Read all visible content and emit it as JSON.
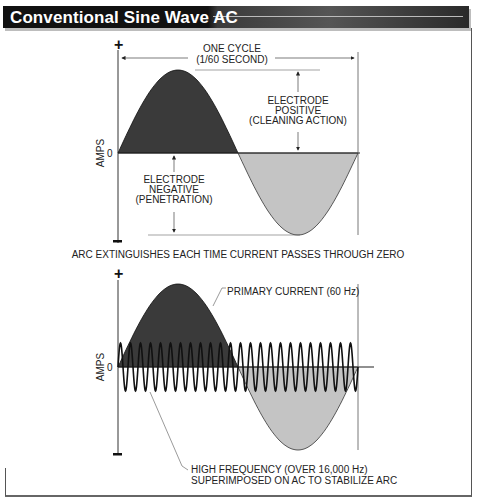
{
  "title": "Conventional Sine Wave AC",
  "colors": {
    "positive_fill": "#3a3a3a",
    "negative_fill": "#c4c4c4",
    "line": "#111111",
    "title_bg": "#111111"
  },
  "top_diagram": {
    "plus_sign": "+",
    "minus_sign": "−",
    "y_axis_label": "AMPS",
    "zero_label": "0",
    "cycle_label_1": "ONE CYCLE",
    "cycle_label_2": "(1/60 SECOND)",
    "positive_label_1": "ELECTRODE",
    "positive_label_2": "POSITIVE",
    "positive_label_3": "(CLEANING ACTION)",
    "negative_label_1": "ELECTRODE",
    "negative_label_2": "NEGATIVE",
    "negative_label_3": "(PENETRATION)",
    "caption": "ARC EXTINGUISHES EACH TIME CURRENT PASSES THROUGH ZERO"
  },
  "bottom_diagram": {
    "plus_sign": "+",
    "minus_sign": "−",
    "y_axis_label": "AMPS",
    "zero_label": "0",
    "primary_label": "PRIMARY CURRENT (60 Hz)",
    "hf_label_1": "HIGH FREQUENCY (OVER 16,000 Hz)",
    "hf_label_2": "SUPERIMPOSED ON AC TO STABILIZE ARC"
  }
}
